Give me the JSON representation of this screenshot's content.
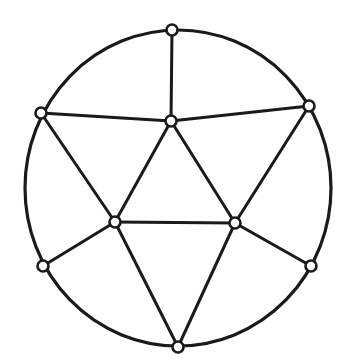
{
  "diagram": {
    "type": "planar-graph",
    "background": "#ffffff",
    "stroke_color": "#1a1a1a",
    "outer_boundary": {
      "cx": 178,
      "cy": 188,
      "rx": 153,
      "ry": 158
    },
    "vertices": [
      {
        "id": "top",
        "x": 172,
        "y": 30
      },
      {
        "id": "upper-left",
        "x": 41,
        "y": 113
      },
      {
        "id": "upper-right",
        "x": 309,
        "y": 106
      },
      {
        "id": "center",
        "x": 171,
        "y": 121
      },
      {
        "id": "inner-left",
        "x": 115,
        "y": 222
      },
      {
        "id": "inner-right",
        "x": 235,
        "y": 223
      },
      {
        "id": "lower-left",
        "x": 43,
        "y": 266
      },
      {
        "id": "lower-right",
        "x": 311,
        "y": 266
      },
      {
        "id": "bottom",
        "x": 178,
        "y": 347
      }
    ],
    "edges": [
      [
        "top",
        "center"
      ],
      [
        "upper-left",
        "center"
      ],
      [
        "upper-right",
        "center"
      ],
      [
        "center",
        "inner-left"
      ],
      [
        "center",
        "inner-right"
      ],
      [
        "inner-left",
        "inner-right"
      ],
      [
        "upper-left",
        "inner-left"
      ],
      [
        "upper-right",
        "inner-right"
      ],
      [
        "inner-left",
        "lower-left"
      ],
      [
        "inner-right",
        "lower-right"
      ],
      [
        "inner-left",
        "bottom"
      ],
      [
        "inner-right",
        "bottom"
      ]
    ],
    "vertex_radius": 5.5
  }
}
